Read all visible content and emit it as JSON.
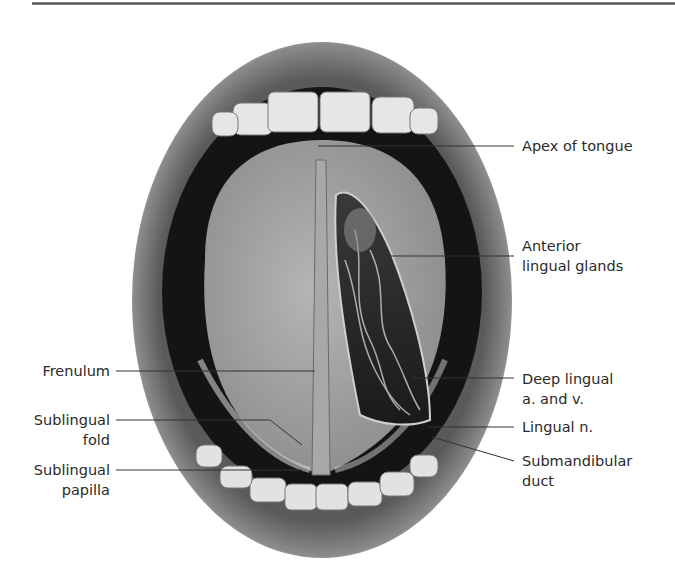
{
  "figure": {
    "labels_right": [
      {
        "id": "apex",
        "lines": [
          "Apex of tongue"
        ]
      },
      {
        "id": "anterior-lingual-glands",
        "lines": [
          "Anterior",
          "lingual glands"
        ]
      },
      {
        "id": "deep-lingual",
        "lines": [
          "Deep lingual",
          "a. and v."
        ]
      },
      {
        "id": "lingual-nerve",
        "lines": [
          "Lingual n."
        ]
      },
      {
        "id": "submandibular-duct",
        "lines": [
          "Submandibular",
          "duct"
        ]
      }
    ],
    "labels_left": [
      {
        "id": "frenulum",
        "lines": [
          "Frenulum"
        ]
      },
      {
        "id": "sublingual-fold",
        "lines": [
          "Sublingual",
          "fold"
        ]
      },
      {
        "id": "sublingual-papilla",
        "lines": [
          "Sublingual",
          "papilla"
        ]
      }
    ]
  }
}
